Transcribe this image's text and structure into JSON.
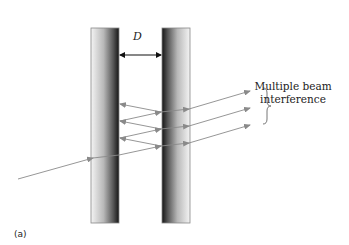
{
  "diagram": {
    "gap_label": "D",
    "annotation_line1": "Multiple beam",
    "annotation_line2": "interference",
    "panel_label": "(a)",
    "colors": {
      "ray": "#8a8a8a",
      "plate_dark": "#1a1a1a",
      "plate_light": "#f2f2f2",
      "plate_border": "#888888",
      "text": "#222222"
    },
    "plates": [
      {
        "name": "left-plate",
        "x": 91,
        "y": 28,
        "width": 28,
        "height": 195,
        "dark_side": "right"
      },
      {
        "name": "right-plate",
        "x": 162,
        "y": 28,
        "width": 28,
        "height": 195,
        "dark_side": "left"
      }
    ],
    "output_rays_count": 3,
    "internal_reflections": 5
  }
}
